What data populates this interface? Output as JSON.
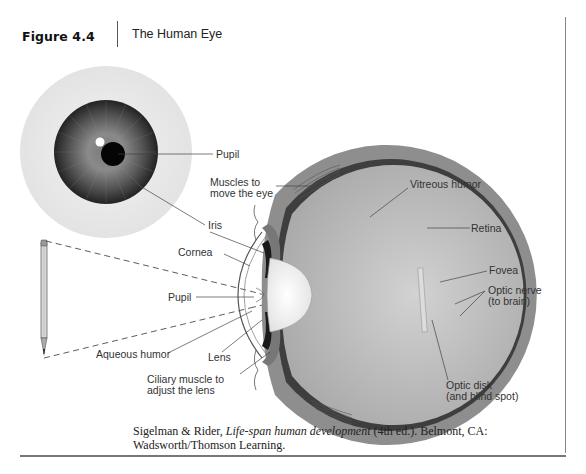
{
  "figure": {
    "number": "Figure 4.4",
    "title": "The Human Eye"
  },
  "labels": {
    "front_pupil": "Pupil",
    "iris": "Iris",
    "muscles_line1": "Muscles to",
    "muscles_line2": "move the eye",
    "vitreous_humor": "Vitreous humor",
    "retina": "Retina",
    "cornea": "Cornea",
    "side_pupil": "Pupil",
    "fovea": "Fovea",
    "optic_nerve_line1": "Optic nerve",
    "optic_nerve_line2": "(to brain)",
    "aqueous_humor": "Aqueous humor",
    "lens": "Lens",
    "ciliary_line1": "Ciliary muscle to",
    "ciliary_line2": "adjust the lens",
    "optic_disk_line1": "Optic disk",
    "optic_disk_line2": "(and blind spot)"
  },
  "caption": {
    "authors": "Sigelman & Rider, ",
    "book_title": "Life-span human development",
    "rest_line1": " (4th ed.). Belmont, CA:",
    "line2": "Wadsworth/Thomson Learning."
  },
  "colors": {
    "sclera_front": "#ececec",
    "iris_dark": "#2a2a2a",
    "iris_mid": "#6a6a6a",
    "pupil": "#050505",
    "sclera_side": "#8e8e8e",
    "choroid": "#3e3e3e",
    "vitreous": "#bdbdbd",
    "lens": "#f4f4f4",
    "optic_nerve": "#555555"
  }
}
